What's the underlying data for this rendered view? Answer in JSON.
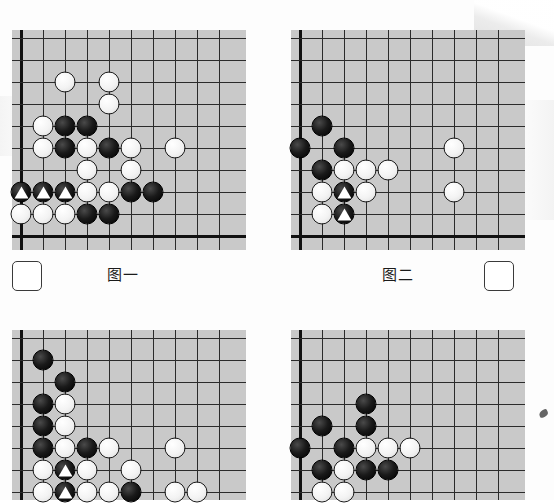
{
  "page": {
    "background_color": "#fdfdfd",
    "board_color": "#c9c9c9",
    "line_color": "#2b2b2b",
    "black_color": "#000000",
    "white_color": "#ffffff"
  },
  "labels": {
    "figure_one": "图一",
    "figure_two": "图二"
  },
  "answer_boxes": [
    {
      "name": "answer-box-left",
      "value": ""
    },
    {
      "name": "answer-box-right",
      "value": ""
    }
  ],
  "boards": [
    {
      "id": "board-1",
      "label": "图一",
      "cols": 10,
      "rows": 10,
      "left": 12,
      "top": 30,
      "width": 234,
      "height": 220,
      "cell": 22,
      "origin_x": 21,
      "origin_y": 38,
      "edges": {
        "left": true,
        "bottom": true,
        "top": false,
        "right": false
      },
      "stones": [
        {
          "color": "white",
          "col": 3,
          "row": 3,
          "mark": ""
        },
        {
          "color": "white",
          "col": 5,
          "row": 3,
          "mark": ""
        },
        {
          "color": "white",
          "col": 5,
          "row": 4,
          "mark": ""
        },
        {
          "color": "white",
          "col": 2,
          "row": 5,
          "mark": ""
        },
        {
          "color": "black",
          "col": 3,
          "row": 5,
          "mark": ""
        },
        {
          "color": "black",
          "col": 4,
          "row": 5,
          "mark": ""
        },
        {
          "color": "white",
          "col": 2,
          "row": 6,
          "mark": ""
        },
        {
          "color": "black",
          "col": 3,
          "row": 6,
          "mark": ""
        },
        {
          "color": "white",
          "col": 4,
          "row": 6,
          "mark": ""
        },
        {
          "color": "black",
          "col": 5,
          "row": 6,
          "mark": ""
        },
        {
          "color": "white",
          "col": 6,
          "row": 6,
          "mark": ""
        },
        {
          "color": "white",
          "col": 8,
          "row": 6,
          "mark": ""
        },
        {
          "color": "white",
          "col": 4,
          "row": 7,
          "mark": ""
        },
        {
          "color": "white",
          "col": 6,
          "row": 7,
          "mark": ""
        },
        {
          "color": "black",
          "col": 1,
          "row": 8,
          "mark": "triangle"
        },
        {
          "color": "black",
          "col": 2,
          "row": 8,
          "mark": "triangle"
        },
        {
          "color": "black",
          "col": 3,
          "row": 8,
          "mark": "triangle"
        },
        {
          "color": "white",
          "col": 4,
          "row": 8,
          "mark": ""
        },
        {
          "color": "white",
          "col": 5,
          "row": 8,
          "mark": ""
        },
        {
          "color": "black",
          "col": 6,
          "row": 8,
          "mark": ""
        },
        {
          "color": "black",
          "col": 7,
          "row": 8,
          "mark": ""
        },
        {
          "color": "white",
          "col": 1,
          "row": 9,
          "mark": ""
        },
        {
          "color": "white",
          "col": 2,
          "row": 9,
          "mark": ""
        },
        {
          "color": "white",
          "col": 3,
          "row": 9,
          "mark": ""
        },
        {
          "color": "black",
          "col": 4,
          "row": 9,
          "mark": ""
        },
        {
          "color": "black",
          "col": 5,
          "row": 9,
          "mark": ""
        }
      ]
    },
    {
      "id": "board-2",
      "label": "图二",
      "cols": 10,
      "rows": 10,
      "left": 291,
      "top": 30,
      "width": 234,
      "height": 220,
      "cell": 22,
      "origin_x": 300,
      "origin_y": 38,
      "edges": {
        "left": true,
        "bottom": true,
        "top": false,
        "right": false
      },
      "stones": [
        {
          "color": "black",
          "col": 2,
          "row": 5,
          "mark": ""
        },
        {
          "color": "black",
          "col": 1,
          "row": 6,
          "mark": ""
        },
        {
          "color": "black",
          "col": 3,
          "row": 6,
          "mark": ""
        },
        {
          "color": "white",
          "col": 8,
          "row": 6,
          "mark": ""
        },
        {
          "color": "black",
          "col": 2,
          "row": 7,
          "mark": ""
        },
        {
          "color": "white",
          "col": 3,
          "row": 7,
          "mark": ""
        },
        {
          "color": "white",
          "col": 4,
          "row": 7,
          "mark": ""
        },
        {
          "color": "white",
          "col": 5,
          "row": 7,
          "mark": ""
        },
        {
          "color": "white",
          "col": 2,
          "row": 8,
          "mark": ""
        },
        {
          "color": "black",
          "col": 3,
          "row": 8,
          "mark": "triangle"
        },
        {
          "color": "white",
          "col": 4,
          "row": 8,
          "mark": ""
        },
        {
          "color": "white",
          "col": 8,
          "row": 8,
          "mark": ""
        },
        {
          "color": "white",
          "col": 2,
          "row": 9,
          "mark": ""
        },
        {
          "color": "black",
          "col": 3,
          "row": 9,
          "mark": "triangle"
        }
      ]
    },
    {
      "id": "board-3",
      "label": "",
      "cols": 10,
      "rows": 8,
      "left": 12,
      "top": 330,
      "width": 234,
      "height": 170,
      "cell": 22,
      "origin_x": 21,
      "origin_y": 338,
      "edges": {
        "left": true,
        "bottom": false,
        "top": false,
        "right": false
      },
      "stones": [
        {
          "color": "black",
          "col": 2,
          "row": 2,
          "mark": ""
        },
        {
          "color": "black",
          "col": 3,
          "row": 3,
          "mark": ""
        },
        {
          "color": "black",
          "col": 2,
          "row": 4,
          "mark": ""
        },
        {
          "color": "white",
          "col": 3,
          "row": 4,
          "mark": ""
        },
        {
          "color": "black",
          "col": 2,
          "row": 5,
          "mark": ""
        },
        {
          "color": "white",
          "col": 3,
          "row": 5,
          "mark": ""
        },
        {
          "color": "black",
          "col": 2,
          "row": 6,
          "mark": ""
        },
        {
          "color": "white",
          "col": 3,
          "row": 6,
          "mark": ""
        },
        {
          "color": "black",
          "col": 4,
          "row": 6,
          "mark": ""
        },
        {
          "color": "white",
          "col": 5,
          "row": 6,
          "mark": ""
        },
        {
          "color": "white",
          "col": 8,
          "row": 6,
          "mark": ""
        },
        {
          "color": "white",
          "col": 2,
          "row": 7,
          "mark": ""
        },
        {
          "color": "black",
          "col": 3,
          "row": 7,
          "mark": "triangle"
        },
        {
          "color": "white",
          "col": 4,
          "row": 7,
          "mark": ""
        },
        {
          "color": "white",
          "col": 6,
          "row": 7,
          "mark": ""
        },
        {
          "color": "white",
          "col": 2,
          "row": 8,
          "mark": ""
        },
        {
          "color": "black",
          "col": 3,
          "row": 8,
          "mark": "triangle"
        },
        {
          "color": "white",
          "col": 4,
          "row": 8,
          "mark": ""
        },
        {
          "color": "white",
          "col": 5,
          "row": 8,
          "mark": ""
        },
        {
          "color": "black",
          "col": 6,
          "row": 8,
          "mark": ""
        },
        {
          "color": "white",
          "col": 8,
          "row": 8,
          "mark": ""
        },
        {
          "color": "white",
          "col": 9,
          "row": 8,
          "mark": ""
        }
      ]
    },
    {
      "id": "board-4",
      "label": "",
      "cols": 10,
      "rows": 8,
      "left": 291,
      "top": 330,
      "width": 234,
      "height": 170,
      "cell": 22,
      "origin_x": 300,
      "origin_y": 338,
      "edges": {
        "left": true,
        "bottom": false,
        "top": false,
        "right": false
      },
      "stones": [
        {
          "color": "black",
          "col": 4,
          "row": 4,
          "mark": ""
        },
        {
          "color": "black",
          "col": 4,
          "row": 5,
          "mark": ""
        },
        {
          "color": "black",
          "col": 2,
          "row": 5,
          "mark": ""
        },
        {
          "color": "black",
          "col": 1,
          "row": 6,
          "mark": ""
        },
        {
          "color": "black",
          "col": 3,
          "row": 6,
          "mark": ""
        },
        {
          "color": "white",
          "col": 4,
          "row": 6,
          "mark": ""
        },
        {
          "color": "white",
          "col": 5,
          "row": 6,
          "mark": ""
        },
        {
          "color": "white",
          "col": 6,
          "row": 6,
          "mark": ""
        },
        {
          "color": "black",
          "col": 2,
          "row": 7,
          "mark": ""
        },
        {
          "color": "white",
          "col": 3,
          "row": 7,
          "mark": ""
        },
        {
          "color": "black",
          "col": 4,
          "row": 7,
          "mark": ""
        },
        {
          "color": "black",
          "col": 5,
          "row": 7,
          "mark": ""
        },
        {
          "color": "white",
          "col": 2,
          "row": 8,
          "mark": ""
        },
        {
          "color": "white",
          "col": 3,
          "row": 8,
          "mark": ""
        }
      ]
    }
  ],
  "label_positions": {
    "figure_one": {
      "left": 107,
      "top": 263
    },
    "figure_two": {
      "left": 382,
      "top": 263
    }
  },
  "answer_box_positions": [
    {
      "left": 12,
      "top": 261
    },
    {
      "left": 484,
      "top": 261
    }
  ]
}
